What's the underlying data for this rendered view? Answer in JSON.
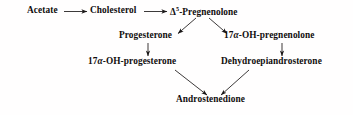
{
  "diagram": {
    "background_color": "#fffefe",
    "text_color": "#100d0d",
    "arrow_color": "#1a1717",
    "nodes": {
      "acetate": "Acetate",
      "cholesterol": "Cholesterol",
      "pregnenolone_prefix": "Δ",
      "pregnenolone_superscript": "5",
      "pregnenolone_suffix": "-Pregnenolone",
      "progesterone": "Progesterone",
      "oh_pregnenolone_prefix": "17",
      "oh_pregnenolone_greek": "α",
      "oh_pregnenolone_suffix": "-OH-pregnenolone",
      "oh_progesterone_prefix": "17",
      "oh_progesterone_greek": "α",
      "oh_progesterone_suffix": "-OH-progesterone",
      "dehydroepiandrosterone": "Dehydroepiandrosterone",
      "androstenedione": "Androstenedione"
    },
    "edges": [
      {
        "name": "acetate-to-cholesterol",
        "from": "Acetate",
        "to": "Cholesterol",
        "style": "horizontal-arrow"
      },
      {
        "name": "cholesterol-to-pregnenolone",
        "from": "Cholesterol",
        "to": "Δ5-Pregnenolone",
        "style": "horizontal-arrow"
      },
      {
        "name": "pregnenolone-to-progesterone",
        "from": "Δ5-Pregnenolone",
        "to": "Progesterone",
        "style": "diagonal-arrow-down-left"
      },
      {
        "name": "pregnenolone-to-oh-pregnenolone",
        "from": "Δ5-Pregnenolone",
        "to": "17α-OH-pregnenolone",
        "style": "diagonal-arrow-down-right"
      },
      {
        "name": "progesterone-to-oh-progesterone",
        "from": "Progesterone",
        "to": "17α-OH-progesterone",
        "style": "vertical-arrow"
      },
      {
        "name": "oh-pregnenolone-to-dhea",
        "from": "17α-OH-pregnenolone",
        "to": "Dehydroepiandrosterone",
        "style": "vertical-arrow"
      },
      {
        "name": "oh-progesterone-to-androstenedione",
        "from": "17α-OH-progesterone",
        "to": "Androstenedione",
        "style": "diagonal-arrow-down-right"
      },
      {
        "name": "dhea-to-androstenedione",
        "from": "Dehydroepiandrosterone",
        "to": "Androstenedione",
        "style": "diagonal-arrow-down-left"
      }
    ]
  }
}
